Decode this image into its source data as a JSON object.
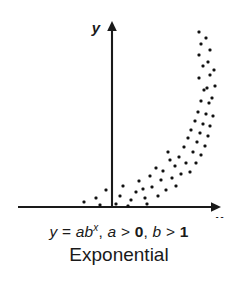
{
  "figure": {
    "name": "exponential-scatter-figure",
    "background_color": "#ffffff",
    "ink_color": "#1a1a1a"
  },
  "axes": {
    "x_label": "x",
    "y_label": "y",
    "x_axis_y_px": 207,
    "y_axis_x_px": 112,
    "x_axis_start_px": 18,
    "x_axis_end_px": 216,
    "y_axis_top_px": 26,
    "arrowheads": true,
    "ticks": false,
    "grid": false
  },
  "caption": {
    "equation_parts": {
      "y": "y",
      "equals": "=",
      "a": "a",
      "b": "b",
      "exponent": "x",
      "comma1": ",",
      "a2": "a",
      "gt1": ">",
      "zero": "0",
      "comma2": ",",
      "b2": "b",
      "gt2": ">",
      "one": "1"
    },
    "equation_text": "y = ab^x, a > 0, b > 1",
    "plot_type": "Exponential"
  },
  "chart_data": {
    "type": "scatter",
    "title": "Exponential",
    "subtitle": "y = ab^x, a > 0, b > 1",
    "xlabel": "x",
    "ylabel": "y",
    "grid": false,
    "legend": null,
    "axis_arrows": true,
    "xlim": [
      -0.6,
      4.4
    ],
    "ylim": [
      0,
      10
    ],
    "marker": {
      "shape": "square-dot",
      "size_px": 3,
      "color": "#111111"
    },
    "points_px": [
      [
        84,
        202
      ],
      [
        96,
        198
      ],
      [
        100,
        205
      ],
      [
        106,
        190
      ],
      [
        116,
        204
      ],
      [
        120,
        196
      ],
      [
        123,
        186
      ],
      [
        131,
        200
      ],
      [
        128,
        206
      ],
      [
        136,
        192
      ],
      [
        139,
        181
      ],
      [
        145,
        198
      ],
      [
        143,
        189
      ],
      [
        150,
        176
      ],
      [
        152,
        187
      ],
      [
        158,
        196
      ],
      [
        147,
        204
      ],
      [
        156,
        168
      ],
      [
        161,
        180
      ],
      [
        166,
        190
      ],
      [
        163,
        171
      ],
      [
        170,
        160
      ],
      [
        172,
        178
      ],
      [
        176,
        186
      ],
      [
        168,
        152
      ],
      [
        175,
        166
      ],
      [
        181,
        174
      ],
      [
        179,
        157
      ],
      [
        184,
        147
      ],
      [
        186,
        163
      ],
      [
        190,
        172
      ],
      [
        188,
        138
      ],
      [
        193,
        152
      ],
      [
        196,
        163
      ],
      [
        191,
        130
      ],
      [
        197,
        142
      ],
      [
        201,
        155
      ],
      [
        195,
        121
      ],
      [
        200,
        133
      ],
      [
        205,
        146
      ],
      [
        198,
        112
      ],
      [
        203,
        124
      ],
      [
        208,
        136
      ],
      [
        201,
        101
      ],
      [
        206,
        114
      ],
      [
        210,
        126
      ],
      [
        204,
        90
      ],
      [
        209,
        103
      ],
      [
        213,
        116
      ],
      [
        199,
        78
      ],
      [
        207,
        88
      ],
      [
        212,
        98
      ],
      [
        203,
        66
      ],
      [
        210,
        75
      ],
      [
        215,
        86
      ],
      [
        199,
        55
      ],
      [
        208,
        62
      ],
      [
        214,
        70
      ],
      [
        201,
        44
      ],
      [
        210,
        50
      ],
      [
        199,
        32
      ],
      [
        206,
        38
      ]
    ],
    "x": [
      -0.55,
      -0.25,
      -0.15,
      0.0,
      0.2,
      0.3,
      0.35,
      0.55,
      0.45,
      0.7,
      0.75,
      0.9,
      0.85,
      1.05,
      1.1,
      1.25,
      0.95,
      1.2,
      1.35,
      1.45,
      1.4,
      1.55,
      1.6,
      1.7,
      1.5,
      1.65,
      1.8,
      1.75,
      1.9,
      1.95,
      2.05,
      2.0,
      2.15,
      2.2,
      2.1,
      2.25,
      2.35,
      2.3,
      2.4,
      2.5,
      2.45,
      2.55,
      2.65,
      2.6,
      2.7,
      2.8,
      2.75,
      2.85,
      2.95,
      2.65,
      2.9,
      3.0,
      2.85,
      3.0,
      3.1,
      2.7,
      2.95,
      3.1,
      2.8,
      3.0,
      2.75,
      2.95
    ],
    "y": [
      0.2,
      0.4,
      0.1,
      0.8,
      0.15,
      0.55,
      1.05,
      0.35,
      0.05,
      0.75,
      1.3,
      0.45,
      0.9,
      1.55,
      1.0,
      0.55,
      0.15,
      1.95,
      1.35,
      0.85,
      1.8,
      2.35,
      1.45,
      1.05,
      2.75,
      2.05,
      1.65,
      2.5,
      3.0,
      2.2,
      1.75,
      3.45,
      2.7,
      2.15,
      3.85,
      3.25,
      2.65,
      4.3,
      3.7,
      3.05,
      4.75,
      4.15,
      3.55,
      5.3,
      4.65,
      4.05,
      5.85,
      5.2,
      4.6,
      6.45,
      5.95,
      5.45,
      7.05,
      6.6,
      6.05,
      7.6,
      7.25,
      6.85,
      8.15,
      7.85,
      8.75,
      8.45
    ]
  }
}
